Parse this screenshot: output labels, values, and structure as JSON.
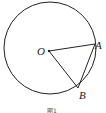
{
  "diagram": {
    "circle": {
      "cx": 50,
      "cy": 48,
      "r": 46
    },
    "points": {
      "O": {
        "label": "O",
        "x": 49,
        "y": 51
      },
      "A": {
        "label": "A",
        "x": 95,
        "y": 44
      },
      "B": {
        "label": "B",
        "x": 78,
        "y": 88
      }
    },
    "segments": [
      "OA",
      "OB",
      "AB"
    ],
    "caption": "图1",
    "stroke_color": "#222222"
  }
}
